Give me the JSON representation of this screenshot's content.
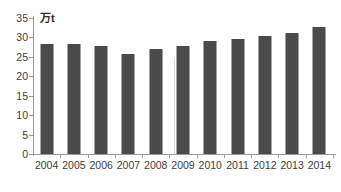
{
  "chart_data": {
    "type": "bar",
    "title": "",
    "subtitle": "",
    "xlabel": "",
    "ylabel": "万t",
    "unit_label": "万t",
    "categories": [
      "2004",
      "2005",
      "2006",
      "2007",
      "2008",
      "2009",
      "2010",
      "2011",
      "2012",
      "2013",
      "2014"
    ],
    "values": [
      28.4,
      28.2,
      27.8,
      25.7,
      27.0,
      27.7,
      29.0,
      29.5,
      30.3,
      31.2,
      32.7
    ],
    "series": [
      {
        "name": "",
        "values": [
          28.4,
          28.2,
          27.8,
          25.7,
          27.0,
          27.7,
          29.0,
          29.5,
          30.3,
          31.2,
          32.7
        ]
      }
    ],
    "ylim": [
      0,
      35
    ],
    "ytick_step": 5,
    "ytick_labels": [
      "35",
      "30",
      "25",
      "20",
      "15",
      "10",
      "5",
      "0"
    ],
    "ytick_values": [
      35,
      30,
      25,
      20,
      15,
      10,
      5,
      0
    ],
    "grid": false,
    "legend": null,
    "legend_position": "none",
    "bar_color": "#4b4b4b",
    "axis_color": "#9a9a9a",
    "text_color": "#3c3c3c",
    "background": "#ffffff"
  }
}
